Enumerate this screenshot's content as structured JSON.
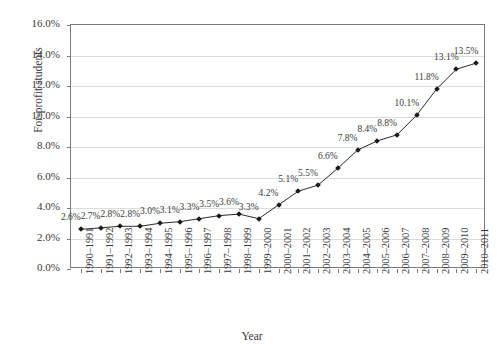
{
  "chart_data": {
    "type": "line",
    "title": "",
    "xlabel": "Year",
    "ylabel": "For-profit students",
    "ylim": [
      0,
      16
    ],
    "yticks": [
      "0.0%",
      "2.0%",
      "4.0%",
      "6.0%",
      "8.0%",
      "10.0%",
      "12.0%",
      "14.0%",
      "16.0%"
    ],
    "ytick_values": [
      0,
      2,
      4,
      6,
      8,
      10,
      12,
      14,
      16
    ],
    "grid": "horizontal",
    "legend": "none",
    "marker": "diamond",
    "line_color": "#2b2b2b",
    "marker_color": "#1a1a1a",
    "grid_color": "#dcdcdc",
    "axis_color": "#7a7a7a",
    "categories": [
      "1990–1991",
      "1991–1992",
      "1992–1993",
      "1993–1994",
      "1994–1995",
      "1995–1996",
      "1996–1997",
      "1997–1998",
      "1998–1999",
      "1999–2000",
      "2000–2001",
      "2001–2002",
      "2002–2003",
      "2003–2004",
      "2004–2005",
      "2005–2006",
      "2006–2007",
      "2007–2008",
      "2008–2009",
      "2009–2010",
      "2010–2011"
    ],
    "values": [
      2.6,
      2.7,
      2.8,
      2.8,
      3.0,
      3.1,
      3.3,
      3.5,
      3.6,
      3.3,
      4.2,
      5.1,
      5.5,
      6.6,
      7.8,
      8.4,
      8.8,
      10.1,
      11.8,
      13.1,
      13.5
    ],
    "data_labels": [
      "2.6%",
      "2.7%",
      "2.8%",
      "2.8%",
      "3.0%",
      "3.1%",
      "3.3%",
      "3.5%",
      "3.6%",
      "3.3%",
      "4.2%",
      "5.1%",
      "5.5%",
      "6.6%",
      "7.8%",
      "8.4%",
      "8.8%",
      "10.1%",
      "11.8%",
      "13.1%",
      "13.5%"
    ]
  }
}
